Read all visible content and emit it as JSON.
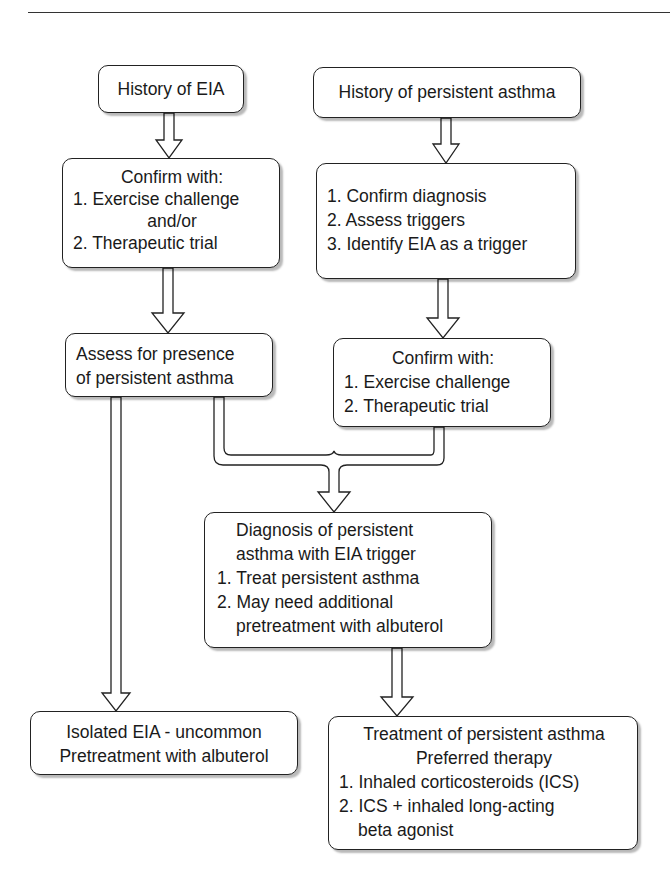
{
  "diagram": {
    "type": "flowchart",
    "title": "",
    "nodes": {
      "history_eia": {
        "lines": [
          "History of EIA"
        ]
      },
      "history_persistent": {
        "lines": [
          "History of persistent asthma"
        ]
      },
      "confirm_left": {
        "lines": [
          "Confirm with:",
          "1. Exercise challenge",
          "and/or",
          "2. Therapeutic trial"
        ]
      },
      "assess_steps": {
        "lines": [
          "1. Confirm diagnosis",
          "2. Assess triggers",
          "3. Identify EIA as a trigger"
        ]
      },
      "assess_presence": {
        "lines": [
          "Assess for presence",
          "of persistent asthma"
        ]
      },
      "confirm_right": {
        "lines": [
          "Confirm with:",
          "1. Exercise challenge",
          "2. Therapeutic trial"
        ]
      },
      "diagnosis": {
        "lines": [
          "Diagnosis of persistent",
          "asthma with EIA trigger",
          "1. Treat persistent asthma",
          "2. May need additional",
          "pretreatment with albuterol"
        ]
      },
      "isolated_eia": {
        "lines": [
          "Isolated EIA - uncommon",
          "Pretreatment with albuterol"
        ]
      },
      "treatment": {
        "lines": [
          "Treatment of persistent asthma",
          "Preferred therapy",
          "1. Inhaled corticosteroids (ICS)",
          "2. ICS + inhaled long-acting",
          "beta agonist"
        ]
      }
    },
    "edges": [
      {
        "from": "history_eia",
        "to": "confirm_left"
      },
      {
        "from": "history_persistent",
        "to": "assess_steps"
      },
      {
        "from": "confirm_left",
        "to": "assess_presence"
      },
      {
        "from": "assess_steps",
        "to": "confirm_right"
      },
      {
        "from": "assess_presence",
        "to": "diagnosis"
      },
      {
        "from": "confirm_right",
        "to": "diagnosis"
      },
      {
        "from": "assess_presence",
        "to": "isolated_eia"
      },
      {
        "from": "diagnosis",
        "to": "treatment"
      }
    ]
  }
}
